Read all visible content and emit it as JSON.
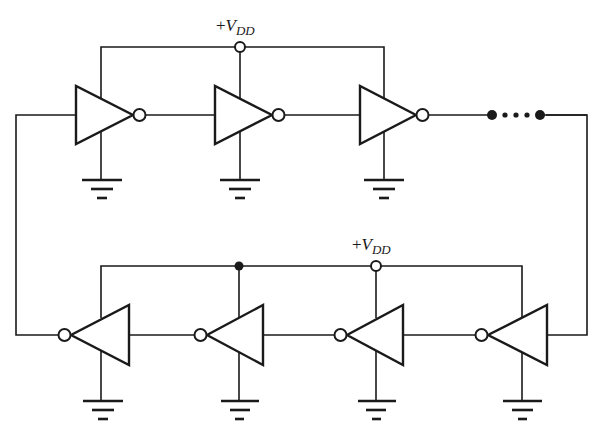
{
  "diagram": {
    "type": "ring-oscillator-schematic",
    "labels": {
      "top_supply": {
        "prefix": "+",
        "symbol": "V",
        "subscript": "DD"
      },
      "bottom_supply": {
        "prefix": "+",
        "symbol": "V",
        "subscript": "DD"
      }
    },
    "top_row": {
      "direction": "left-to-right",
      "inverters": 3,
      "continuation": "ellipsis-dots"
    },
    "bottom_row": {
      "direction": "right-to-left",
      "inverters": 4
    },
    "colors": {
      "line": "#1a1a1a",
      "background": "#ffffff"
    }
  }
}
